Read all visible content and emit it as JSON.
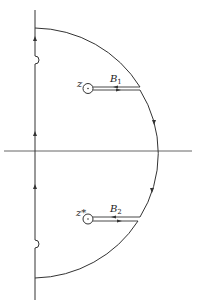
{
  "diagram": {
    "type": "contour-integration",
    "labels": {
      "pole_upper": "z",
      "pole_lower": "z*",
      "branch_upper": "B",
      "branch_upper_sub": "1",
      "branch_lower": "B",
      "branch_lower_sub": "2"
    },
    "colors": {
      "stroke": "#333333",
      "background": "#ffffff"
    }
  }
}
